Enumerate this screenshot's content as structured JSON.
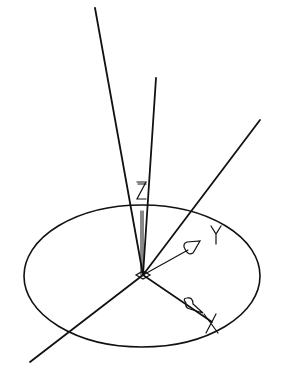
{
  "diagram": {
    "type": "3d-coordinate-system",
    "background": "#ffffff",
    "stroke_color": "#111111",
    "axis_labels": {
      "x": "X",
      "y": "Y",
      "z": "Z"
    },
    "origin": [
      143,
      275
    ],
    "ellipse": {
      "cx": 142,
      "cy": 276,
      "rx": 118,
      "ry": 71
    },
    "rays": [
      {
        "name": "ray-long-upper-left",
        "x1": 143,
        "y1": 275,
        "x2": 95,
        "y2": 8
      },
      {
        "name": "ray-upper-center",
        "x1": 143,
        "y1": 275,
        "x2": 156,
        "y2": 78
      },
      {
        "name": "ray-upper-right",
        "x1": 143,
        "y1": 275,
        "x2": 260,
        "y2": 120
      },
      {
        "name": "ray-lower-left",
        "x1": 143,
        "y1": 275,
        "x2": 30,
        "y2": 362
      }
    ]
  }
}
